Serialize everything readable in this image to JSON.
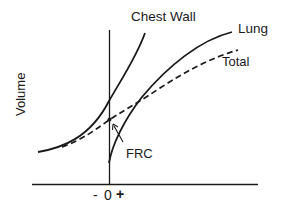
{
  "figure": {
    "ylabel": "Volume",
    "xticks": {
      "minus": "-",
      "zero": "0",
      "plus": "+"
    },
    "curves": {
      "chest_wall": {
        "label": "Chest Wall",
        "style": "solid"
      },
      "lung": {
        "label": "Lung",
        "style": "solid"
      },
      "total": {
        "label": "Total",
        "style": "dashed"
      }
    },
    "annotation": {
      "label": "FRC"
    },
    "colors": {
      "ink": "#1a1a1a",
      "background": "#ffffff"
    }
  }
}
